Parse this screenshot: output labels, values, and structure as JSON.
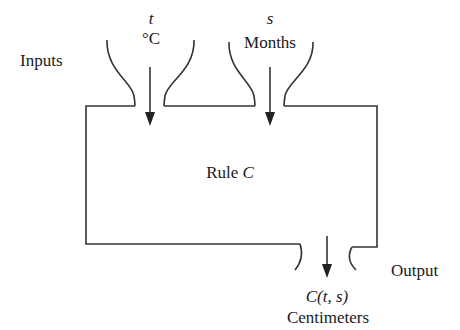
{
  "diagram": {
    "type": "function-machine",
    "inputs_label": "Inputs",
    "output_label": "Output",
    "rule_label": {
      "prefix": "Rule ",
      "name": "C"
    },
    "inputs": [
      {
        "variable": "t",
        "unit": "°C"
      },
      {
        "variable": "s",
        "unit": "Months"
      }
    ],
    "output": {
      "expression": "C(t, s)",
      "unit": "Centimeters"
    },
    "colors": {
      "stroke": "#333333",
      "text": "#1a1a1a",
      "background": "#ffffff"
    }
  }
}
